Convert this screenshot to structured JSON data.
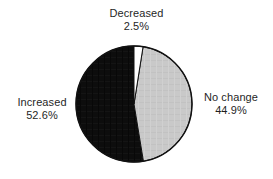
{
  "chart_data": {
    "type": "pie",
    "title": "",
    "subtitle": "",
    "xlabel": "",
    "ylabel": "",
    "legend_position": "none",
    "grid": false,
    "start_angle_deg": 90,
    "direction": "clockwise",
    "categories": [
      "Decreased",
      "No change",
      "Increased"
    ],
    "values": [
      2.5,
      44.9,
      52.6
    ],
    "value_suffix": "%",
    "slice_colors": [
      "#ffffff",
      "#c9c9c9",
      "#0d0d0d"
    ],
    "outline_color": "#111111",
    "slices": [
      {
        "name": "Decreased",
        "value": 2.5,
        "label": "Decreased",
        "value_label": "2.5%",
        "color": "#ffffff",
        "label_position": "top"
      },
      {
        "name": "No change",
        "value": 44.9,
        "label": "No change",
        "value_label": "44.9%",
        "color": "#c9c9c9",
        "label_position": "right"
      },
      {
        "name": "Increased",
        "value": 52.6,
        "label": "Increased",
        "value_label": "52.6%",
        "color": "#0d0d0d",
        "label_position": "left"
      }
    ]
  },
  "figure": {
    "background": "#ffffff",
    "pie": {
      "center_x": 134,
      "center_y": 104,
      "radius": 58
    }
  },
  "labels": {
    "decreased": {
      "name": "Decreased",
      "value": "2.5%"
    },
    "increased": {
      "name": "Increased",
      "value": "52.6%"
    },
    "no_change": {
      "name": "No change",
      "value": "44.9%"
    }
  }
}
